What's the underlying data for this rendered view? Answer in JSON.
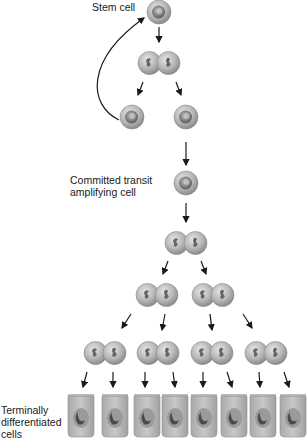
{
  "diagram": {
    "labels": {
      "stem_cell": "Stem cell",
      "committed_line1": "Committed transit",
      "committed_line2": "amplifying cell",
      "terminal_line1": "Terminally",
      "terminal_line2": "differentiated",
      "terminal_line3": "cells"
    },
    "stages": [
      {
        "name": "stem-cell",
        "count": 1
      },
      {
        "name": "dividing-stem-cell",
        "count": 1
      },
      {
        "name": "daughter-cells",
        "count": 2
      },
      {
        "name": "committed-transit-amplifying-cell",
        "count": 1
      },
      {
        "name": "dividing-transit-cell",
        "count": 1
      },
      {
        "name": "dividing-transit-cells-gen2",
        "count": 2
      },
      {
        "name": "dividing-transit-cells-gen3",
        "count": 4
      },
      {
        "name": "terminally-differentiated-cells",
        "count": 8
      }
    ],
    "colors": {
      "cell_fill": "#b5b5b5",
      "cell_edge": "#8a8a8a",
      "nucleus": "#6e6e6e",
      "arrow": "#1a1a1a"
    }
  }
}
